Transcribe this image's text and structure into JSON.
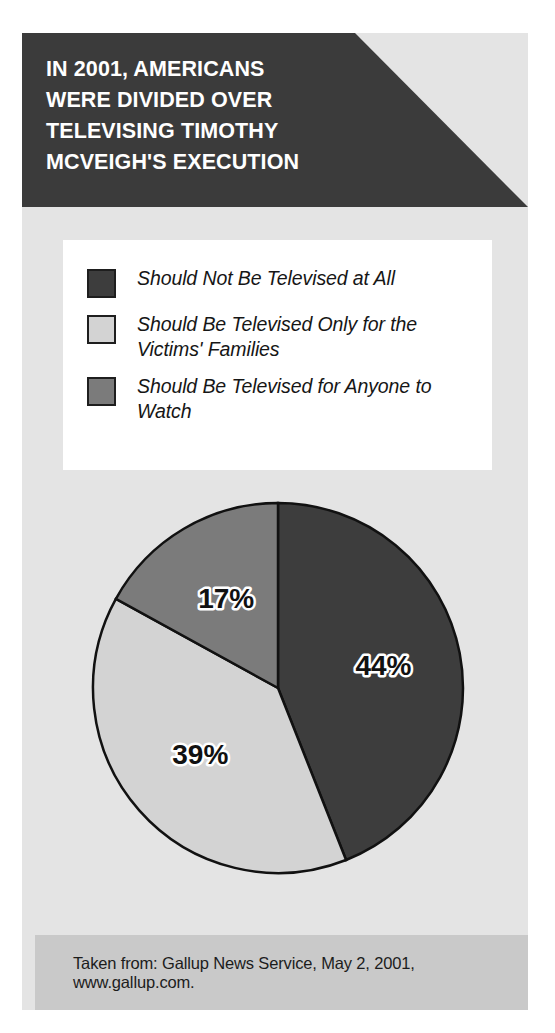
{
  "header": {
    "title": "IN 2001, AMERICANS\nWERE DIVIDED OVER\nTELEVISING TIMOTHY\nMCVEIGH'S EXECUTION"
  },
  "legend": {
    "items": [
      {
        "label": "Should Not Be Televised at All",
        "color": "#3d3d3d"
      },
      {
        "label": "Should Be Televised Only for the Victims' Families",
        "color": "#d3d3d3"
      },
      {
        "label": "Should Be Televised for Anyone to Watch",
        "color": "#7b7b7b"
      }
    ]
  },
  "source": {
    "text": "Taken from: Gallup News Service, May 2, 2001, www.gallup.com."
  },
  "chart_data": {
    "type": "pie",
    "title": "IN 2001, AMERICANS WERE DIVIDED OVER TELEVISING TIMOTHY MCVEIGH'S EXECUTION",
    "xlabel": "",
    "ylabel": "",
    "unit": "percent",
    "legend_position": "top",
    "grid": false,
    "start_angle_deg": 0,
    "direction": "clockwise",
    "categories": [
      "Should Not Be Televised at All",
      "Should Be Televised Only for the Victims' Families",
      "Should Be Televised for Anyone to Watch"
    ],
    "values": [
      44,
      39,
      17
    ],
    "data_labels": [
      "44%",
      "39%",
      "17%"
    ],
    "colors": [
      "#3d3d3d",
      "#d3d3d3",
      "#7b7b7b"
    ],
    "source": "Taken from: Gallup News Service, May 2, 2001, www.gallup.com."
  },
  "labels": {
    "slice_1": "44%",
    "slice_2": "39%",
    "slice_3": "17%"
  }
}
